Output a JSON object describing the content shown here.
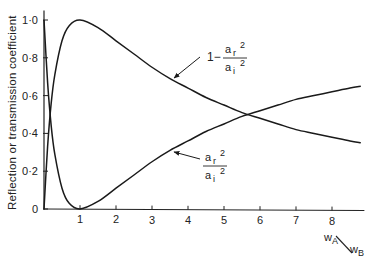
{
  "chart_data": {
    "type": "line",
    "title": "",
    "xlabel": "wA/wB",
    "xlabel_parts": {
      "num": "w",
      "num_sub": "A",
      "den": "w",
      "den_sub": "B"
    },
    "ylabel": "Reflection or transmission coefficient",
    "xlim": [
      0,
      8.9
    ],
    "ylim": [
      0,
      1.05
    ],
    "x_ticks": [
      1,
      2,
      3,
      4,
      5,
      6,
      7,
      8
    ],
    "x_tick_labels": [
      "1",
      "2",
      "3",
      "4",
      "5",
      "6",
      "7",
      "8"
    ],
    "y_ticks": [
      0,
      0.2,
      0.4,
      0.6,
      0.8,
      1.0
    ],
    "y_tick_labels": [
      "0",
      "0·2",
      "0·4",
      "0·6",
      "0·8",
      "1·0"
    ],
    "grid": false,
    "legend": "inline annotations with arrows",
    "series": [
      {
        "name": "transmission",
        "label": "1 − ar²/ai²",
        "label_parts": {
          "prefix": "1−",
          "num": "a",
          "num_sub": "r",
          "den": "a",
          "den_sub": "i",
          "exp": "2"
        },
        "x": [
          0,
          0.1,
          0.2,
          0.3,
          0.5,
          0.7,
          1.0,
          1.5,
          2,
          2.5,
          3,
          3.5,
          4,
          4.5,
          5,
          5.5,
          6,
          6.5,
          7,
          7.5,
          8,
          8.5,
          8.8
        ],
        "values": [
          0,
          0.33,
          0.56,
          0.71,
          0.89,
          0.97,
          1.0,
          0.96,
          0.89,
          0.82,
          0.75,
          0.69,
          0.64,
          0.59,
          0.55,
          0.51,
          0.48,
          0.45,
          0.42,
          0.4,
          0.38,
          0.36,
          0.35
        ]
      },
      {
        "name": "reflection",
        "label": "ar²/ai²",
        "label_parts": {
          "num": "a",
          "num_sub": "r",
          "den": "a",
          "den_sub": "i",
          "exp": "2"
        },
        "x": [
          0,
          0.1,
          0.2,
          0.3,
          0.5,
          0.7,
          1.0,
          1.5,
          2,
          2.5,
          3,
          3.5,
          4,
          4.5,
          5,
          5.5,
          6,
          6.5,
          7,
          7.5,
          8,
          8.5,
          8.8
        ],
        "values": [
          1.0,
          0.67,
          0.44,
          0.29,
          0.11,
          0.03,
          0.0,
          0.04,
          0.11,
          0.18,
          0.25,
          0.31,
          0.36,
          0.41,
          0.45,
          0.49,
          0.52,
          0.55,
          0.58,
          0.6,
          0.62,
          0.64,
          0.65
        ]
      }
    ],
    "annotations": [
      {
        "text": "1 − ar²/ai²",
        "points_to": {
          "x": 3.6,
          "y": 0.68
        }
      },
      {
        "text": "ar²/ai²",
        "points_to": {
          "x": 3.5,
          "y": 0.31
        }
      }
    ]
  }
}
